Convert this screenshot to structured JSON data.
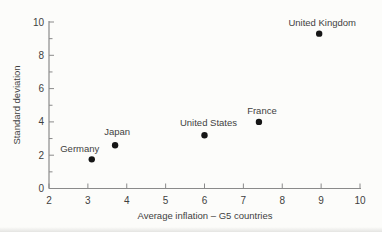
{
  "figure": {
    "background_color": "#fcfcfa"
  },
  "chart_data": {
    "type": "scatter",
    "title": "",
    "xlabel": "Average inflation – G5 countries",
    "ylabel": "Standard deviation",
    "xlim": [
      2,
      10
    ],
    "ylim": [
      0,
      10
    ],
    "x_ticks": [
      2,
      3,
      4,
      5,
      6,
      7,
      8,
      9,
      10
    ],
    "y_ticks_major": [
      0,
      2,
      4,
      6,
      8,
      10
    ],
    "y_ticks_minor": [
      1,
      3,
      5,
      7,
      9
    ],
    "grid": false,
    "legend": "none",
    "marker": "filled-circle",
    "colors": {
      "point": "#161616",
      "axis": "#8a8a8a",
      "text": "#3f3f3f"
    },
    "points": [
      {
        "label": "Germany",
        "x": 3.1,
        "y": 1.75,
        "label_dx": -12,
        "label_dy": -7
      },
      {
        "label": "Japan",
        "x": 3.7,
        "y": 2.6,
        "label_dx": 2,
        "label_dy": -10
      },
      {
        "label": "United States",
        "x": 6.0,
        "y": 3.2,
        "label_dx": 4,
        "label_dy": -9
      },
      {
        "label": "France",
        "x": 7.4,
        "y": 4.0,
        "label_dx": 3,
        "label_dy": -7.5
      },
      {
        "label": "United Kingdom",
        "x": 8.95,
        "y": 9.3,
        "label_dx": 3,
        "label_dy": -8
      }
    ]
  }
}
